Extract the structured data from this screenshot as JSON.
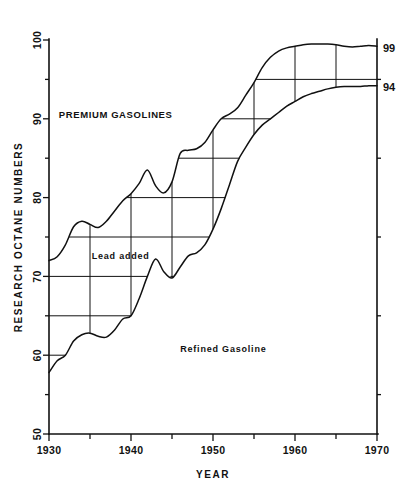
{
  "chart_data": {
    "type": "line",
    "title": "",
    "xlabel": "YEAR",
    "ylabel": "RESEARCH OCTANE NUMBERS",
    "xlim": [
      1930,
      1970
    ],
    "ylim": [
      50,
      100
    ],
    "grid": true,
    "grid_note": "Horizontal rules every 5 octane numbers and vertical rules every 5 years, drawn only inside the band between the two curves",
    "x_tick_labels": [
      "1930",
      "1940",
      "1950",
      "1960",
      "1970"
    ],
    "x_minor_ticks": [
      1935,
      1945,
      1955,
      1965
    ],
    "y_tick_labels": [
      "50",
      "60",
      "70",
      "80",
      "90",
      "100"
    ],
    "y_minor_ticks": [
      55,
      65,
      75,
      85,
      95
    ],
    "end_labels": [
      {
        "text": "99",
        "value": 99,
        "series": "Premium Gasolines"
      },
      {
        "text": "94",
        "value": 94,
        "series": "Refined Gasoline"
      }
    ],
    "annotations": [
      {
        "text": "PREMIUM  GASOLINES",
        "x": 1931.2,
        "y": 90.5
      },
      {
        "text": "Lead added",
        "x": 1935.2,
        "y": 72.6
      },
      {
        "text": "Refined  Gasoline",
        "x": 1946.0,
        "y": 60.8
      }
    ],
    "series": [
      {
        "name": "Premium Gasolines",
        "x": [
          1930,
          1931,
          1932,
          1933,
          1934,
          1935,
          1936,
          1937,
          1938,
          1939,
          1940,
          1941,
          1942,
          1943,
          1944,
          1945,
          1946,
          1947,
          1948,
          1949,
          1950,
          1951,
          1952,
          1953,
          1954,
          1955,
          1956,
          1957,
          1958,
          1959,
          1960,
          1961,
          1962,
          1963,
          1964,
          1965,
          1966,
          1967,
          1968,
          1969,
          1970
        ],
        "values": [
          72.0,
          72.5,
          74.0,
          76.3,
          77.0,
          76.6,
          76.2,
          77.0,
          78.3,
          79.6,
          80.5,
          81.8,
          83.5,
          81.5,
          80.6,
          82.0,
          85.6,
          86.0,
          86.2,
          87.0,
          88.6,
          90.0,
          90.6,
          91.4,
          93.0,
          94.6,
          96.5,
          97.8,
          98.6,
          99.0,
          99.2,
          99.4,
          99.5,
          99.5,
          99.5,
          99.4,
          99.2,
          99.1,
          99.2,
          99.3,
          99.2
        ]
      },
      {
        "name": "Refined Gasoline",
        "x": [
          1930,
          1931,
          1932,
          1933,
          1934,
          1935,
          1936,
          1937,
          1938,
          1939,
          1940,
          1941,
          1942,
          1943,
          1944,
          1945,
          1946,
          1947,
          1948,
          1949,
          1950,
          1951,
          1952,
          1953,
          1954,
          1955,
          1956,
          1957,
          1958,
          1959,
          1960,
          1961,
          1962,
          1963,
          1964,
          1965,
          1966,
          1967,
          1968,
          1969,
          1970
        ],
        "values": [
          57.8,
          59.3,
          60.0,
          61.8,
          62.6,
          62.8,
          62.4,
          62.3,
          63.2,
          64.6,
          65.0,
          67.2,
          70.0,
          72.2,
          70.6,
          69.8,
          71.2,
          72.6,
          73.0,
          74.0,
          76.0,
          78.6,
          81.6,
          84.6,
          86.4,
          88.0,
          89.2,
          90.0,
          90.8,
          91.6,
          92.2,
          92.8,
          93.2,
          93.5,
          93.8,
          94.0,
          94.1,
          94.1,
          94.1,
          94.2,
          94.2
        ]
      }
    ],
    "colors": {
      "line": "#111111",
      "grid": "#111111",
      "background": "#ffffff"
    }
  },
  "axis": {
    "y_title": "RESEARCH OCTANE NUMBERS",
    "x_title": "YEAR"
  }
}
